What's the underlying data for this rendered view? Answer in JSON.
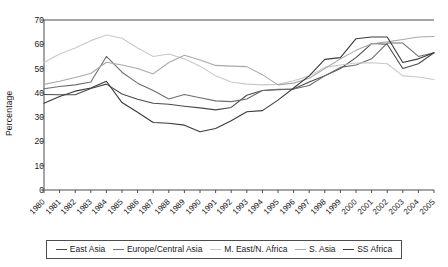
{
  "chart_data": {
    "type": "line",
    "title": "",
    "xlabel": "",
    "ylabel": "Percentage",
    "ylim": [
      0,
      70
    ],
    "ytick_values": [
      0,
      10,
      20,
      30,
      40,
      50,
      60,
      70
    ],
    "grid": false,
    "legend_position": "bottom",
    "x": [
      "1980",
      "1981",
      "1982",
      "1983",
      "1984",
      "1985",
      "1986",
      "1987",
      "1988",
      "1989",
      "1990",
      "1991",
      "1992",
      "1993",
      "1994",
      "1995",
      "1996",
      "1997",
      "1998",
      "1999",
      "2000",
      "2001",
      "2002",
      "2003",
      "2004",
      "2005"
    ],
    "series": [
      {
        "name": "East Asia",
        "color": "#4a4a4a",
        "values": [
          39.3,
          39.2,
          39.2,
          41.8,
          43.6,
          39.5,
          37.4,
          35.7,
          35.3,
          34.5,
          33.8,
          33.0,
          34.0,
          39.0,
          41.0,
          41.3,
          41.6,
          44.5,
          47.0,
          50.0,
          54.5,
          60.3,
          60.0,
          50.0,
          52.0,
          56.5
        ]
      },
      {
        "name": "Europe/Central Asia",
        "color": "#6e6e6e",
        "values": [
          41.7,
          42.6,
          43.3,
          44.5,
          55.0,
          48.5,
          44.0,
          41.0,
          37.5,
          39.3,
          38.0,
          36.7,
          36.4,
          37.5,
          41.0,
          41.5,
          41.6,
          43.0,
          47.0,
          50.5,
          51.5,
          54.0,
          60.5,
          60.5,
          55.0,
          56.5
        ]
      },
      {
        "name": "M. East/N. Africa",
        "color": "#c9c9c9",
        "values": [
          52.5,
          56.0,
          58.5,
          61.5,
          63.8,
          62.5,
          58.5,
          55.0,
          56.0,
          54.0,
          51.0,
          47.0,
          44.5,
          43.6,
          43.3,
          43.5,
          45.0,
          47.0,
          50.5,
          51.5,
          52.3,
          52.4,
          52.0,
          47.0,
          46.5,
          45.5
        ]
      },
      {
        "name": "S. Asia",
        "color": "#a9a9a9",
        "values": [
          43.5,
          44.8,
          46.3,
          48.0,
          52.6,
          51.5,
          50.0,
          47.8,
          52.5,
          55.5,
          53.5,
          51.3,
          51.0,
          50.8,
          47.5,
          43.3,
          44.0,
          46.0,
          50.0,
          54.0,
          57.5,
          60.2,
          61.0,
          62.0,
          63.0,
          63.2
        ]
      },
      {
        "name": "SS Africa",
        "color": "#3a3a3a",
        "values": [
          35.7,
          38.5,
          40.7,
          42.0,
          44.8,
          36.0,
          32.0,
          27.8,
          27.5,
          26.7,
          24.0,
          25.3,
          28.5,
          32.2,
          32.7,
          37.0,
          42.0,
          47.0,
          53.8,
          54.5,
          62.3,
          63.0,
          63.0,
          52.5,
          54.0,
          56.5
        ]
      }
    ]
  },
  "legend": {
    "items": [
      {
        "label": "East Asia"
      },
      {
        "label": "Europe/Central Asia"
      },
      {
        "label": "M. East/N. Africa"
      },
      {
        "label": "S. Asia"
      },
      {
        "label": "SS Africa"
      }
    ]
  },
  "axis": {
    "frame_color": "#4d4d4d",
    "tick_color": "#4d4d4d"
  }
}
